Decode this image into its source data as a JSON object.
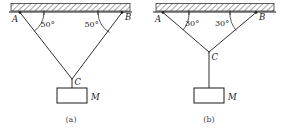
{
  "figure": {
    "stroke_color": "#1a1a1a",
    "background_color": "#ffffff",
    "panels": [
      {
        "id": "a",
        "caption": "(a)",
        "anchor_left_label": "A",
        "anchor_right_label": "B",
        "junction_label": "C",
        "mass_label": "M",
        "angle_left": "50°",
        "angle_right": "50°",
        "has_vertical_segment": false,
        "ceiling_hatched": true
      },
      {
        "id": "b",
        "caption": "(b)",
        "anchor_left_label": "A",
        "anchor_right_label": "B",
        "junction_label": "C",
        "mass_label": "M",
        "angle_left": "30°",
        "angle_right": "30°",
        "has_vertical_segment": true,
        "ceiling_hatched": true
      }
    ]
  }
}
